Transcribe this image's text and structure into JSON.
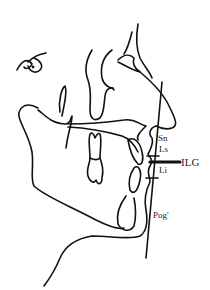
{
  "figure": {
    "line_color": "#111111",
    "background": "#ffffff"
  },
  "landmarks": {
    "sn": "Sn",
    "ls": "Ls",
    "ilg": "ILG",
    "li": "Li",
    "pog": "Pog'"
  }
}
